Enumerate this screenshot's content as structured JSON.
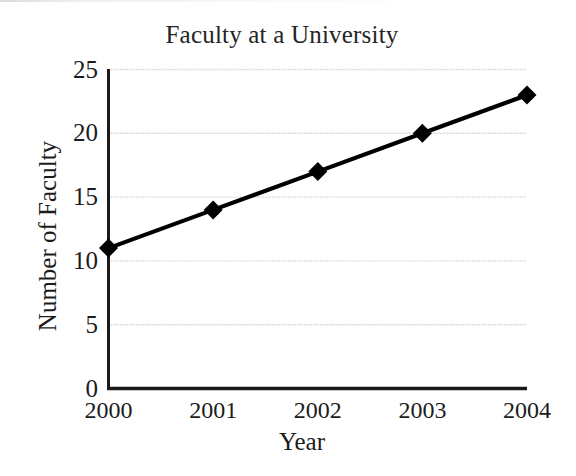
{
  "chart_data": {
    "type": "line",
    "title": "Faculty at a University",
    "xlabel": "Year",
    "ylabel": "Number of Faculty",
    "categories": [
      "2000",
      "2001",
      "2002",
      "2003",
      "2004"
    ],
    "x": [
      2000,
      2001,
      2002,
      2003,
      2004
    ],
    "values": [
      11,
      14,
      17,
      20,
      23
    ],
    "series": [
      {
        "name": "Number of Faculty",
        "values": [
          11,
          14,
          17,
          20,
          23
        ]
      }
    ],
    "ylim": [
      0,
      25
    ],
    "yticks": [
      "0",
      "5",
      "10",
      "15",
      "20",
      "25"
    ],
    "ytick_values": [
      0,
      5,
      10,
      15,
      20,
      25
    ],
    "xticks": [
      "2000",
      "2001",
      "2002",
      "2003",
      "2004"
    ],
    "grid": "horizontal",
    "legend": "none",
    "marker": "diamond",
    "line_color": "#000000",
    "marker_color": "#000000",
    "grid_color": "#d0d0d0",
    "axis_color": "#1a1a1a",
    "background_color": "#ffffff"
  }
}
